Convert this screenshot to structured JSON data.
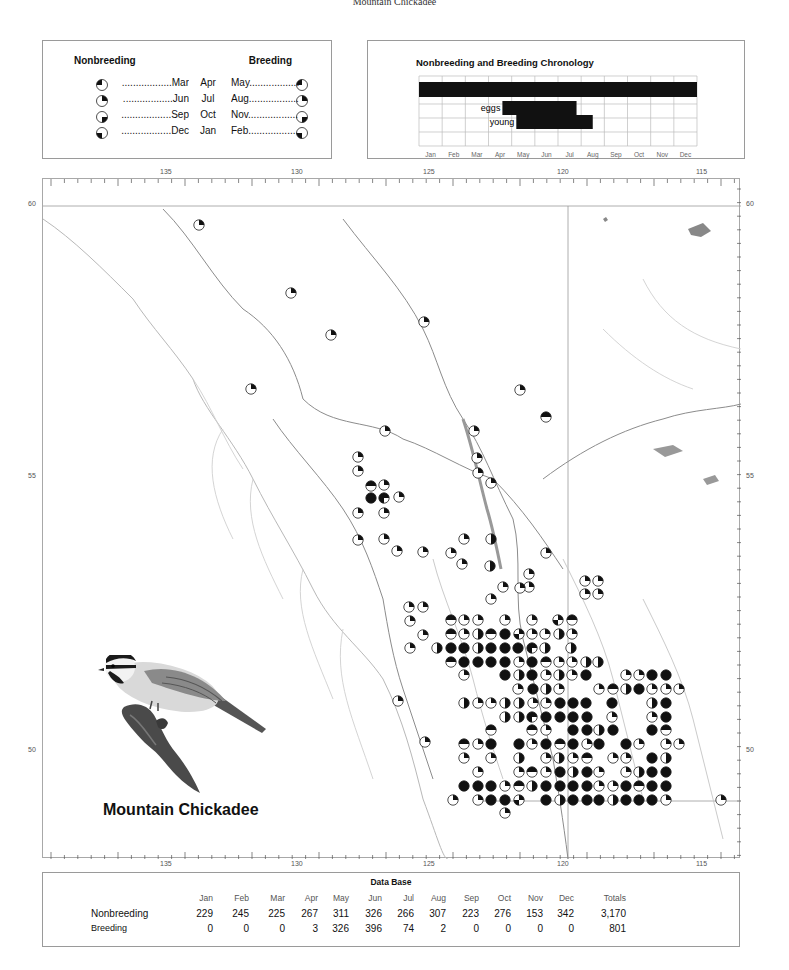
{
  "page": {
    "header": "Mountain Chickadee",
    "species_name": "Mountain Chickadee"
  },
  "legend": {
    "nonbreeding_label": "Nonbreeding",
    "breeding_label": "Breeding",
    "rows": [
      {
        "nonbreeding_month": "..................Mar",
        "middle_a": "Apr",
        "breeding_month": "May..................",
        "nb_quadrant": 4,
        "br_quadrant": 4
      },
      {
        "nonbreeding_month": "..................Jun",
        "middle_a": "Jul",
        "breeding_month": "Aug..................",
        "nb_quadrant": 1,
        "br_quadrant": 1
      },
      {
        "nonbreeding_month": "..................Sep",
        "middle_a": "Oct",
        "breeding_month": "Nov..................",
        "nb_quadrant": 2,
        "br_quadrant": 2
      },
      {
        "nonbreeding_month": "..................Dec",
        "middle_a": "Jan",
        "breeding_month": "Feb..................",
        "nb_quadrant": 3,
        "br_quadrant": 3
      }
    ]
  },
  "chronology": {
    "title": "Nonbreeding and Breeding Chronology",
    "months": [
      "Jan",
      "Feb",
      "Mar",
      "Apr",
      "May",
      "Jun",
      "Jul",
      "Aug",
      "Sep",
      "Oct",
      "Nov",
      "Dec"
    ],
    "bars": [
      {
        "label": "",
        "row": 1,
        "start": 0.0,
        "end": 12.0
      },
      {
        "label": "eggs",
        "row": 2,
        "start": 3.6,
        "end": 6.8
      },
      {
        "label": "young",
        "row": 3,
        "start": 4.2,
        "end": 7.5
      }
    ]
  },
  "map": {
    "longitude_ticks": [
      "135",
      "130",
      "125",
      "120",
      "115"
    ],
    "latitude_ticks": [
      "60",
      "55",
      "50"
    ],
    "symbol_note": "quadrant fills: 1=NE(Jun-Aug) 2=SE(Sep-Nov) 3=SW(Dec-Feb) 4=NW(Mar-May)",
    "nonbreeding_symbols": [
      [
        198,
        224,
        "1"
      ],
      [
        290,
        292,
        "1"
      ],
      [
        330,
        334,
        "1"
      ],
      [
        423,
        321,
        "1"
      ],
      [
        250,
        388,
        "1"
      ],
      [
        519,
        389,
        "1"
      ],
      [
        545,
        416,
        "14"
      ],
      [
        384,
        430,
        "1"
      ],
      [
        357,
        456,
        "1"
      ],
      [
        473,
        430,
        "1"
      ],
      [
        357,
        470,
        "1"
      ],
      [
        370,
        485,
        "14"
      ],
      [
        383,
        484,
        "1"
      ],
      [
        398,
        496,
        "1"
      ],
      [
        370,
        497,
        "1234"
      ],
      [
        383,
        497,
        "134"
      ],
      [
        476,
        457,
        "1"
      ],
      [
        477,
        472,
        "1"
      ],
      [
        357,
        512,
        "1"
      ],
      [
        383,
        512,
        "1"
      ],
      [
        490,
        482,
        "1"
      ],
      [
        357,
        539,
        "1"
      ],
      [
        383,
        538,
        "1"
      ],
      [
        396,
        550,
        "1"
      ],
      [
        422,
        551,
        "1"
      ],
      [
        463,
        538,
        "1"
      ],
      [
        490,
        538,
        "12"
      ],
      [
        450,
        552,
        "1"
      ],
      [
        528,
        573,
        "1"
      ],
      [
        528,
        586,
        "1"
      ],
      [
        545,
        552,
        "1"
      ],
      [
        519,
        587,
        "1"
      ],
      [
        584,
        580,
        "1"
      ],
      [
        597,
        580,
        "1"
      ],
      [
        584,
        593,
        "1"
      ],
      [
        597,
        593,
        "1"
      ],
      [
        461,
        563,
        "1"
      ],
      [
        489,
        565,
        "12"
      ],
      [
        502,
        586,
        "1"
      ],
      [
        408,
        606,
        "1"
      ],
      [
        422,
        606,
        "1"
      ],
      [
        490,
        598,
        "1"
      ],
      [
        409,
        620,
        "1"
      ],
      [
        422,
        634,
        "1"
      ],
      [
        450,
        619,
        "14"
      ],
      [
        463,
        619,
        "1"
      ],
      [
        477,
        619,
        "1"
      ],
      [
        504,
        619,
        "1"
      ],
      [
        531,
        619,
        "1"
      ],
      [
        557,
        619,
        "13"
      ],
      [
        571,
        619,
        "14"
      ],
      [
        450,
        633,
        "14"
      ],
      [
        463,
        633,
        "1"
      ],
      [
        477,
        633,
        "12"
      ],
      [
        490,
        633,
        "14"
      ],
      [
        504,
        633,
        "1234"
      ],
      [
        518,
        633,
        "13"
      ],
      [
        531,
        633,
        "1"
      ],
      [
        544,
        633,
        "1"
      ],
      [
        558,
        633,
        "12"
      ],
      [
        571,
        633,
        "1"
      ],
      [
        436,
        647,
        "12"
      ],
      [
        450,
        647,
        "1234"
      ],
      [
        463,
        647,
        "1234"
      ],
      [
        477,
        647,
        "12"
      ],
      [
        490,
        647,
        "1234"
      ],
      [
        504,
        647,
        "1234"
      ],
      [
        517,
        647,
        "1234"
      ],
      [
        531,
        647,
        "134"
      ],
      [
        544,
        647,
        "12"
      ],
      [
        570,
        647,
        "12"
      ],
      [
        450,
        661,
        "14"
      ],
      [
        463,
        661,
        "1234"
      ],
      [
        477,
        661,
        "1234"
      ],
      [
        490,
        661,
        "1234"
      ],
      [
        504,
        661,
        "1234"
      ],
      [
        518,
        661,
        "1"
      ],
      [
        531,
        661,
        "1234"
      ],
      [
        545,
        661,
        "14"
      ],
      [
        558,
        661,
        "1"
      ],
      [
        571,
        661,
        "1"
      ],
      [
        585,
        661,
        "12"
      ],
      [
        597,
        661,
        "12"
      ],
      [
        409,
        647,
        "1"
      ],
      [
        463,
        674,
        "1"
      ],
      [
        504,
        674,
        "1234"
      ],
      [
        518,
        674,
        "12"
      ],
      [
        531,
        674,
        "1234"
      ],
      [
        545,
        674,
        "1"
      ],
      [
        558,
        674,
        "12"
      ],
      [
        571,
        674,
        "1"
      ],
      [
        585,
        674,
        "1234"
      ],
      [
        625,
        674,
        "1"
      ],
      [
        638,
        674,
        "1"
      ],
      [
        651,
        674,
        "1234"
      ],
      [
        665,
        674,
        "1234"
      ],
      [
        517,
        688,
        "1"
      ],
      [
        532,
        688,
        "1234"
      ],
      [
        545,
        688,
        "12"
      ],
      [
        558,
        688,
        "1"
      ],
      [
        598,
        688,
        "1"
      ],
      [
        612,
        688,
        "14"
      ],
      [
        625,
        688,
        "12"
      ],
      [
        638,
        688,
        "1234"
      ],
      [
        651,
        688,
        "1"
      ],
      [
        665,
        688,
        "1"
      ],
      [
        678,
        688,
        "1"
      ],
      [
        504,
        702,
        "12"
      ],
      [
        518,
        702,
        "12"
      ],
      [
        532,
        702,
        "1"
      ],
      [
        545,
        702,
        "1"
      ],
      [
        559,
        702,
        "1234"
      ],
      [
        572,
        702,
        "1234"
      ],
      [
        585,
        702,
        "1234"
      ],
      [
        611,
        702,
        "1234"
      ],
      [
        651,
        702,
        "12"
      ],
      [
        665,
        702,
        "1234"
      ],
      [
        463,
        702,
        "12"
      ],
      [
        477,
        702,
        "1"
      ],
      [
        490,
        702,
        "1"
      ],
      [
        504,
        716,
        "12"
      ],
      [
        518,
        716,
        "12"
      ],
      [
        531,
        716,
        "134"
      ],
      [
        545,
        716,
        "1234"
      ],
      [
        559,
        716,
        "1234"
      ],
      [
        572,
        716,
        "1234"
      ],
      [
        586,
        716,
        "1234"
      ],
      [
        611,
        716,
        "1"
      ],
      [
        651,
        716,
        "1"
      ],
      [
        665,
        716,
        "1234"
      ],
      [
        490,
        729,
        "14"
      ],
      [
        531,
        729,
        "14"
      ],
      [
        545,
        729,
        "1"
      ],
      [
        572,
        729,
        "1234"
      ],
      [
        586,
        729,
        "1234"
      ],
      [
        598,
        729,
        "12"
      ],
      [
        612,
        729,
        "1234"
      ],
      [
        651,
        729,
        "1234"
      ],
      [
        665,
        729,
        "14"
      ],
      [
        463,
        743,
        "14"
      ],
      [
        477,
        743,
        "1"
      ],
      [
        490,
        743,
        "1234"
      ],
      [
        518,
        743,
        "1234"
      ],
      [
        531,
        743,
        "1"
      ],
      [
        545,
        743,
        "1234"
      ],
      [
        559,
        743,
        "14"
      ],
      [
        572,
        743,
        "1234"
      ],
      [
        586,
        743,
        "1"
      ],
      [
        598,
        743,
        "1234"
      ],
      [
        625,
        743,
        "1234"
      ],
      [
        638,
        743,
        "1"
      ],
      [
        665,
        743,
        "1"
      ],
      [
        678,
        743,
        "1"
      ],
      [
        463,
        757,
        "1"
      ],
      [
        490,
        757,
        "1"
      ],
      [
        518,
        757,
        "12"
      ],
      [
        545,
        757,
        "1"
      ],
      [
        558,
        757,
        "12"
      ],
      [
        572,
        757,
        "1"
      ],
      [
        586,
        757,
        "14"
      ],
      [
        612,
        757,
        "1"
      ],
      [
        625,
        757,
        "1"
      ],
      [
        651,
        757,
        "1234"
      ],
      [
        665,
        757,
        "12"
      ],
      [
        477,
        771,
        "1"
      ],
      [
        518,
        771,
        "1"
      ],
      [
        531,
        771,
        "14"
      ],
      [
        545,
        771,
        "1"
      ],
      [
        559,
        771,
        "1234"
      ],
      [
        572,
        771,
        "12"
      ],
      [
        586,
        771,
        "1234"
      ],
      [
        598,
        771,
        "1"
      ],
      [
        625,
        771,
        "1"
      ],
      [
        638,
        771,
        "12"
      ],
      [
        651,
        771,
        "1234"
      ],
      [
        665,
        771,
        "1234"
      ],
      [
        463,
        785,
        "1234"
      ],
      [
        477,
        785,
        "1234"
      ],
      [
        490,
        785,
        "1234"
      ],
      [
        504,
        785,
        "1"
      ],
      [
        518,
        785,
        "14"
      ],
      [
        531,
        785,
        "12"
      ],
      [
        545,
        785,
        "1234"
      ],
      [
        559,
        785,
        "1234"
      ],
      [
        572,
        785,
        "1234"
      ],
      [
        586,
        785,
        "1234"
      ],
      [
        598,
        785,
        "1"
      ],
      [
        612,
        785,
        "1"
      ],
      [
        625,
        785,
        "1234"
      ],
      [
        638,
        785,
        "14"
      ],
      [
        651,
        785,
        "1234"
      ],
      [
        665,
        785,
        "1234"
      ],
      [
        477,
        799,
        "1"
      ],
      [
        490,
        799,
        "1234"
      ],
      [
        504,
        799,
        "1234"
      ],
      [
        518,
        799,
        "13"
      ],
      [
        545,
        799,
        "1234"
      ],
      [
        559,
        799,
        "12"
      ],
      [
        572,
        799,
        "1234"
      ],
      [
        586,
        799,
        "1234"
      ],
      [
        598,
        799,
        "1234"
      ],
      [
        612,
        799,
        "12"
      ],
      [
        625,
        799,
        "1234"
      ],
      [
        638,
        799,
        "1234"
      ],
      [
        651,
        799,
        "1234"
      ],
      [
        665,
        799,
        "1"
      ],
      [
        720,
        799,
        "1"
      ],
      [
        424,
        741,
        "1"
      ],
      [
        397,
        700,
        "1"
      ],
      [
        452,
        799,
        "1"
      ],
      [
        504,
        812,
        "1"
      ]
    ]
  },
  "database": {
    "title": "Data Base",
    "columns": [
      "Jan",
      "Feb",
      "Mar",
      "Apr",
      "May",
      "Jun",
      "Jul",
      "Aug",
      "Sep",
      "Oct",
      "Nov",
      "Dec",
      "Totals"
    ],
    "rows": [
      {
        "label": "Nonbreeding",
        "values": [
          "229",
          "245",
          "225",
          "267",
          "311",
          "326",
          "266",
          "307",
          "223",
          "276",
          "153",
          "342",
          "3,170"
        ]
      },
      {
        "label": "Breeding",
        "values": [
          "0",
          "0",
          "0",
          "3",
          "326",
          "396",
          "74",
          "2",
          "0",
          "0",
          "0",
          "0",
          "801"
        ]
      }
    ]
  },
  "colors": {
    "symbol_fill": "#111111",
    "border": "#9a9a9a",
    "map_lines": "#b8b8b8",
    "water": "#9e9e9e"
  },
  "chart_data": {
    "type": "table",
    "title": "Data Base",
    "categories": [
      "Jan",
      "Feb",
      "Mar",
      "Apr",
      "May",
      "Jun",
      "Jul",
      "Aug",
      "Sep",
      "Oct",
      "Nov",
      "Dec"
    ],
    "series": [
      {
        "name": "Nonbreeding",
        "values": [
          229,
          245,
          225,
          267,
          311,
          326,
          266,
          307,
          223,
          276,
          153,
          342
        ],
        "total": 3170
      },
      {
        "name": "Breeding",
        "values": [
          0,
          0,
          0,
          3,
          326,
          396,
          74,
          2,
          0,
          0,
          0,
          0
        ],
        "total": 801
      }
    ],
    "chronology": {
      "title": "Nonbreeding and Breeding Chronology",
      "type": "gantt",
      "bars": [
        {
          "label": "occurrence",
          "start_month": "Jan",
          "end_month": "Dec"
        },
        {
          "label": "eggs",
          "start_month": "mid-Apr",
          "end_month": "late Jul"
        },
        {
          "label": "young",
          "start_month": "early May",
          "end_month": "mid Aug"
        }
      ]
    }
  }
}
